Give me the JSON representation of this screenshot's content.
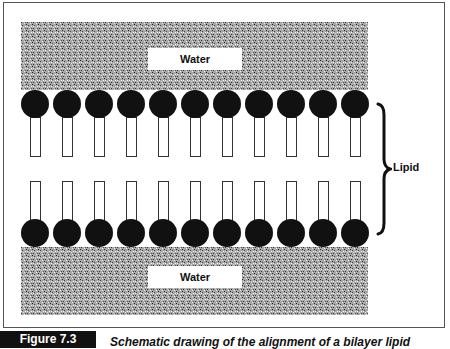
{
  "figure": {
    "number_label": "Figure 7.3",
    "caption": "Schematic drawing of the alignment of a bilayer lipid"
  },
  "diagram": {
    "top_water": {
      "label": "Water"
    },
    "bottom_water": {
      "label": "Water"
    },
    "brace_label": "Lipid",
    "molecules_per_leaflet": 11,
    "leaflets": [
      "upper",
      "lower"
    ],
    "colors": {
      "head": "#111111",
      "tail_outline": "#333333",
      "water_texture": "#9a9a9a",
      "frame": "#555555",
      "caption_box": "#111111"
    }
  }
}
